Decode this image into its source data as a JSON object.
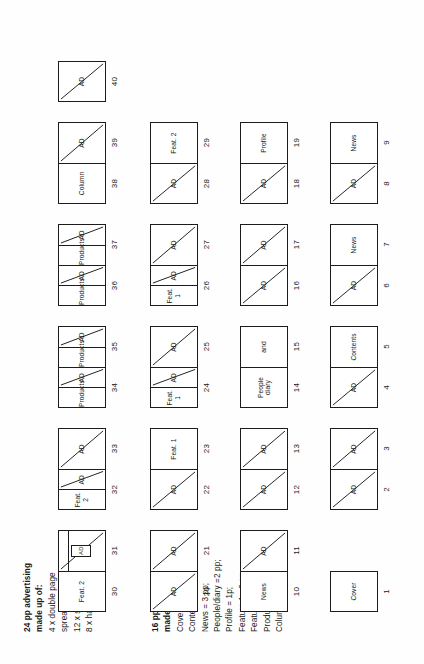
{
  "document": {
    "title": "Magazine flatplan 40 pages"
  },
  "notes": {
    "advertising": {
      "heading": "24 pp advertising",
      "subheading": "made up of:",
      "lines": [
        "4 x double page",
        "spread;",
        "12 x single page",
        "8 x half-page."
      ]
    },
    "editorial": {
      "heading": "16 pp editorial",
      "subheading": "made up of:",
      "lines": [
        "Cover = 1p;",
        "Contents/editorial =  1p",
        "News = 3 pp;",
        "People/diary =2 pp;",
        "Profile = 1p;",
        "Feature 1= 2 pp",
        "Feature 2 = 3 pp",
        "Products = 2 pp;",
        "Columnist = 1p."
      ]
    }
  },
  "labels": {
    "ad": "AD",
    "cover": "Cover",
    "contents": "Contents",
    "news": "News",
    "people_and": "People and",
    "people_diary": "People\ndiary",
    "profile": "Profile",
    "feature1": "Feat. 1",
    "feature2": "Feat. 2",
    "products": "Products",
    "column": "Column"
  },
  "rows": [
    {
      "id": "row-1",
      "spreads": [
        {
          "id": "spread-1",
          "pages": [
            {
              "number": "1",
              "kind": "editorial",
              "label": "Cover",
              "slash": false
            }
          ]
        },
        {
          "id": "spread-2-3",
          "pages": [
            {
              "number": "2",
              "kind": "ad",
              "label": "AD",
              "slash": true
            },
            {
              "number": "3",
              "kind": "ad",
              "label": "AD",
              "slash": true
            }
          ]
        },
        {
          "id": "spread-4-5",
          "pages": [
            {
              "number": "4",
              "kind": "ad",
              "label": "AD",
              "slash": true
            },
            {
              "number": "5",
              "kind": "editorial",
              "label": "Contents",
              "slash": false
            }
          ]
        },
        {
          "id": "spread-6-7",
          "pages": [
            {
              "number": "6",
              "kind": "ad",
              "label": "AD",
              "slash": true
            },
            {
              "number": "7",
              "kind": "editorial",
              "label": "News",
              "slash": false
            }
          ]
        },
        {
          "id": "spread-8-9",
          "pages": [
            {
              "number": "8",
              "kind": "ad",
              "label": "AD",
              "slash": true
            },
            {
              "number": "9",
              "kind": "editorial",
              "label": "News",
              "slash": false
            }
          ]
        }
      ]
    },
    {
      "id": "row-2",
      "spreads": [
        {
          "id": "spread-10-11",
          "pages": [
            {
              "number": "10",
              "kind": "editorial",
              "label": "News",
              "slash": false
            },
            {
              "number": "11",
              "kind": "ad",
              "label": "AD",
              "slash": true
            }
          ]
        },
        {
          "id": "spread-12-13",
          "pages": [
            {
              "number": "12",
              "kind": "ad",
              "label": "AD",
              "slash": true
            },
            {
              "number": "13",
              "kind": "ad",
              "label": "AD",
              "slash": true
            }
          ]
        },
        {
          "id": "spread-14-15",
          "pages": [
            {
              "number": "14",
              "kind": "editorial",
              "label": "People\ndiary",
              "slash": false
            },
            {
              "number": "15",
              "kind": "editorial",
              "label": "and",
              "slash": false
            }
          ]
        },
        {
          "id": "spread-16-17",
          "pages": [
            {
              "number": "16",
              "kind": "ad",
              "label": "AD",
              "slash": true
            },
            {
              "number": "17",
              "kind": "ad",
              "label": "AD",
              "slash": true
            }
          ]
        },
        {
          "id": "spread-18-19",
          "pages": [
            {
              "number": "18",
              "kind": "ad",
              "label": "AD",
              "slash": true
            },
            {
              "number": "19",
              "kind": "editorial",
              "label": "Profile",
              "slash": false
            }
          ]
        }
      ]
    },
    {
      "id": "row-3",
      "spreads": [
        {
          "id": "spread-20-21",
          "pages": [
            {
              "number": "20",
              "kind": "ad",
              "label": "AD",
              "slash": true
            },
            {
              "number": "21",
              "kind": "ad",
              "label": "AD",
              "slash": true
            }
          ]
        },
        {
          "id": "spread-22-23",
          "pages": [
            {
              "number": "22",
              "kind": "ad",
              "label": "AD",
              "slash": true
            },
            {
              "number": "23",
              "kind": "editorial",
              "label": "Feat. 1",
              "slash": false
            }
          ]
        },
        {
          "id": "spread-24-25",
          "pages": [
            {
              "number": "24",
              "kind": "half",
              "label": "Feat. 1",
              "ad_label": "AD",
              "slash": true
            },
            {
              "number": "25",
              "kind": "ad",
              "label": "AD",
              "slash": true
            }
          ]
        },
        {
          "id": "spread-26-27",
          "pages": [
            {
              "number": "26",
              "kind": "half",
              "label": "Feat. 1",
              "ad_label": "AD",
              "slash": true
            },
            {
              "number": "27",
              "kind": "ad",
              "label": "AD",
              "slash": true
            }
          ]
        },
        {
          "id": "spread-28-29",
          "pages": [
            {
              "number": "28",
              "kind": "ad",
              "label": "AD",
              "slash": true
            },
            {
              "number": "29",
              "kind": "editorial",
              "label": "Feat. 2",
              "slash": false
            }
          ]
        }
      ]
    },
    {
      "id": "row-4",
      "spreads": [
        {
          "id": "spread-30-31",
          "pages": [
            {
              "number": "30",
              "kind": "editorial",
              "label": "Feat. 2",
              "slash": false
            },
            {
              "number": "31",
              "kind": "minibox",
              "label": "",
              "ad_label": "AD",
              "slash": true
            }
          ]
        },
        {
          "id": "spread-32-33",
          "pages": [
            {
              "number": "32",
              "kind": "half",
              "label": "Feat. 2",
              "ad_label": "AD",
              "slash": true
            },
            {
              "number": "33",
              "kind": "ad",
              "label": "AD",
              "slash": true
            }
          ]
        },
        {
          "id": "spread-34-35",
          "pages": [
            {
              "number": "34",
              "kind": "half",
              "label": "Products",
              "ad_label": "AD",
              "slash": true
            },
            {
              "number": "35",
              "kind": "half",
              "label": "Products",
              "ad_label": "AD",
              "slash": true
            }
          ]
        },
        {
          "id": "spread-36-37",
          "pages": [
            {
              "number": "36",
              "kind": "half",
              "label": "Products",
              "ad_label": "AD",
              "slash": true
            },
            {
              "number": "37",
              "kind": "half",
              "label": "Products",
              "ad_label": "AD",
              "slash": true
            }
          ]
        },
        {
          "id": "spread-38-39",
          "pages": [
            {
              "number": "38",
              "kind": "editorial",
              "label": "Column",
              "slash": false
            },
            {
              "number": "39",
              "kind": "ad",
              "label": "AD",
              "slash": true
            }
          ]
        },
        {
          "id": "spread-40",
          "pages": [
            {
              "number": "40",
              "kind": "ad",
              "label": "AD",
              "slash": true
            }
          ]
        }
      ]
    }
  ],
  "colors": {
    "ink": "#1c1c1c",
    "paper": "#ffffff",
    "background": "#fefefe"
  }
}
